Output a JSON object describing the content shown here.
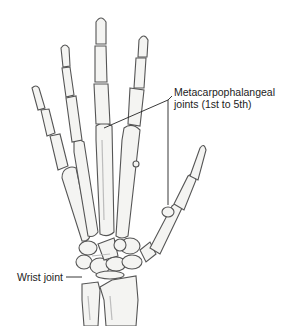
{
  "figure": {
    "labels": {
      "mcp_line1": "Metacarpophalangeal",
      "mcp_line2": "joints (1st to 5th)",
      "wrist": "Wrist joint"
    },
    "caption": "",
    "colors": {
      "bone_fill": "#f4f4f2",
      "bone_stroke": "#555555",
      "shade": "#bdbdbd",
      "leader_line": "#222222",
      "text": "#222222"
    }
  }
}
